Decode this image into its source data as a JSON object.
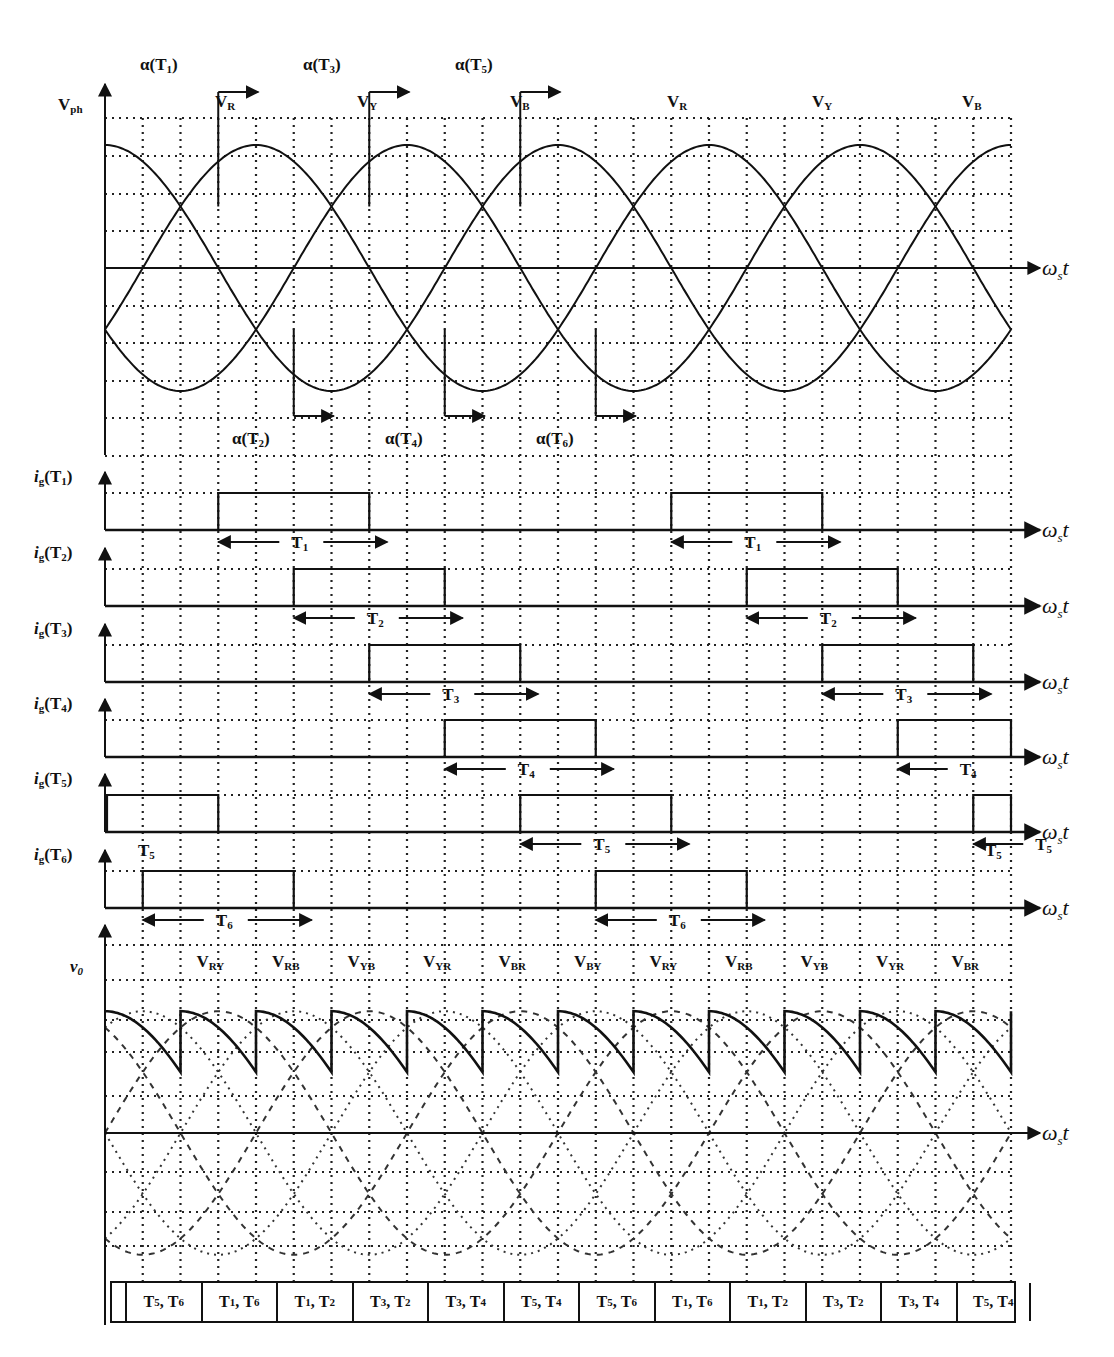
{
  "figure": {
    "top_panel": {
      "y_label": "V",
      "y_label_sub": "ph",
      "x_label": "ω",
      "x_label_sub": "s",
      "x_label_suffix": "t",
      "phase_labels": [
        {
          "main": "V",
          "sub": "R",
          "x": 215
        },
        {
          "main": "V",
          "sub": "Y",
          "x": 357
        },
        {
          "main": "V",
          "sub": "B",
          "x": 510
        },
        {
          "main": "V",
          "sub": "R",
          "x": 667
        },
        {
          "main": "V",
          "sub": "Y",
          "x": 812
        },
        {
          "main": "V",
          "sub": "B",
          "x": 962
        }
      ],
      "firing_top": [
        {
          "text": "α(T",
          "sub": "1",
          "close": ")",
          "x": 140
        },
        {
          "text": "α(T",
          "sub": "3",
          "close": ")",
          "x": 303
        },
        {
          "text": "α(T",
          "sub": "5",
          "close": ")",
          "x": 455
        }
      ],
      "firing_bottom": [
        {
          "text": "α(T",
          "sub": "2",
          "close": ")",
          "x": 232
        },
        {
          "text": "α(T",
          "sub": "4",
          "close": ")",
          "x": 385
        },
        {
          "text": "α(T",
          "sub": "6",
          "close": ")",
          "x": 536
        }
      ]
    },
    "gate_rows": [
      {
        "label": "i",
        "label_sub": "g",
        "name": "(T",
        "name_sub": "1",
        "close": ")",
        "arrow_label": "T",
        "arrow_sub": "1"
      },
      {
        "label": "i",
        "label_sub": "g",
        "name": "(T",
        "name_sub": "2",
        "close": ")",
        "arrow_label": "T",
        "arrow_sub": "2"
      },
      {
        "label": "i",
        "label_sub": "g",
        "name": "(T",
        "name_sub": "3",
        "close": ")",
        "arrow_label": "T",
        "arrow_sub": "3"
      },
      {
        "label": "i",
        "label_sub": "g",
        "name": "(T",
        "name_sub": "4",
        "close": ")",
        "arrow_label": "T",
        "arrow_sub": "4"
      },
      {
        "label": "i",
        "label_sub": "g",
        "name": "(T",
        "name_sub": "5",
        "close": ")",
        "arrow_label": "T",
        "arrow_sub": "5"
      },
      {
        "label": "i",
        "label_sub": "g",
        "name": "(T",
        "name_sub": "6",
        "close": ")",
        "arrow_label": "T",
        "arrow_sub": "6"
      }
    ],
    "output_panel": {
      "y_label": "v",
      "y_label_sub": "0",
      "line_voltage_labels": [
        {
          "main": "V",
          "sub": "RY"
        },
        {
          "main": "V",
          "sub": "RB"
        },
        {
          "main": "V",
          "sub": "YB"
        },
        {
          "main": "V",
          "sub": "YR"
        },
        {
          "main": "V",
          "sub": "BR"
        },
        {
          "main": "V",
          "sub": "BY"
        },
        {
          "main": "V",
          "sub": "RY"
        },
        {
          "main": "V",
          "sub": "RB"
        },
        {
          "main": "V",
          "sub": "YB"
        },
        {
          "main": "V",
          "sub": "YR"
        },
        {
          "main": "V",
          "sub": "BR"
        }
      ]
    },
    "conduction_table": [
      {
        "a": "T",
        "as": "5",
        "b": "T",
        "bs": "6"
      },
      {
        "a": "T",
        "as": "1",
        "b": "T",
        "bs": "6"
      },
      {
        "a": "T",
        "as": "1",
        "b": "T",
        "bs": "2"
      },
      {
        "a": "T",
        "as": "3",
        "b": "T",
        "bs": "2"
      },
      {
        "a": "T",
        "as": "3",
        "b": "T",
        "bs": "4"
      },
      {
        "a": "T",
        "as": "5",
        "b": "T",
        "bs": "4"
      },
      {
        "a": "T",
        "as": "5",
        "b": "T",
        "bs": "6"
      },
      {
        "a": "T",
        "as": "1",
        "b": "T",
        "bs": "6"
      },
      {
        "a": "T",
        "as": "1",
        "b": "T",
        "bs": "2"
      },
      {
        "a": "T",
        "as": "3",
        "b": "T",
        "bs": "2"
      },
      {
        "a": "T",
        "as": "3",
        "b": "T",
        "bs": "4"
      },
      {
        "a": "T",
        "as": "5",
        "b": "T",
        "bs": "4"
      }
    ]
  },
  "geometry": {
    "x0": 105,
    "x_end": 1012,
    "grid_step": 37.75,
    "deg_per_px": 0.7947,
    "top_axis_y": 268,
    "top_amp": 123,
    "firing_angle_deg": 30,
    "pulse_width_deg": 120,
    "gate_baselines": [
      530,
      606,
      682,
      757,
      832,
      908
    ],
    "gate_pulse_height": 37,
    "out_axis_y": 1133,
    "out_amp": 210
  },
  "chart_data": {
    "type": "line",
    "panels": [
      {
        "name": "phase voltages",
        "ylabel": "Vph",
        "xlabel": "ωs t",
        "series": [
          {
            "name": "VR",
            "function": "sin(ωt)",
            "peaks_deg": [
              90,
              450
            ]
          },
          {
            "name": "VY",
            "function": "sin(ωt - 120°)",
            "peaks_deg": [
              210,
              570
            ]
          },
          {
            "name": "VB",
            "function": "sin(ωt + 120°)",
            "peaks_deg": [
              330,
              690
            ]
          }
        ],
        "x_range_deg": [
          -30,
          690
        ],
        "grid": true,
        "firing_points_deg": {
          "T1": 60,
          "T2": 120,
          "T3": 180,
          "T4": 240,
          "T5": 300,
          "T6": 360
        }
      },
      {
        "name": "gate pulses",
        "series": [
          {
            "name": "ig(T1)",
            "on_deg": [
              [
                60,
                180
              ],
              [
                420,
                540
              ]
            ]
          },
          {
            "name": "ig(T2)",
            "on_deg": [
              [
                120,
                240
              ],
              [
                480,
                600
              ]
            ]
          },
          {
            "name": "ig(T3)",
            "on_deg": [
              [
                180,
                300
              ],
              [
                540,
                660
              ]
            ]
          },
          {
            "name": "ig(T4)",
            "on_deg": [
              [
                240,
                360
              ],
              [
                600,
                690
              ]
            ]
          },
          {
            "name": "ig(T5)",
            "on_deg": [
              [
                -30,
                60
              ],
              [
                300,
                420
              ],
              [
                660,
                690
              ]
            ]
          },
          {
            "name": "ig(T6)",
            "on_deg": [
              [
                0,
                120
              ],
              [
                360,
                480
              ]
            ]
          }
        ]
      },
      {
        "name": "output voltage",
        "ylabel": "v0",
        "xlabel": "ωs t",
        "segment_labels": [
          "VRY",
          "VRB",
          "VYB",
          "VYR",
          "VBR",
          "VBY",
          "VRY",
          "VRB",
          "VYB",
          "VYR",
          "VBR"
        ],
        "segment_width_deg": 60,
        "grid": true
      }
    ],
    "conduction_pairs": [
      "T5,T6",
      "T1,T6",
      "T1,T2",
      "T3,T2",
      "T3,T4",
      "T5,T4",
      "T5,T6",
      "T1,T6",
      "T1,T2",
      "T3,T2",
      "T3,T4",
      "T5,T4"
    ]
  }
}
